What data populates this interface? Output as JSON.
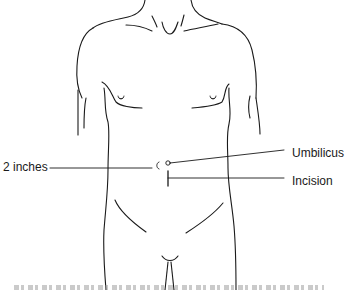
{
  "diagram": {
    "stroke_color": "#1a1a1a",
    "background": "#ffffff",
    "labels": {
      "umbilicus": "Umbilicus",
      "incision": "Incision",
      "two_inches": "2 inches"
    },
    "caption_visible": false
  }
}
